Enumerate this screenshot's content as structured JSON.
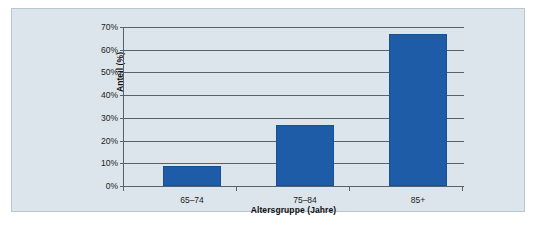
{
  "chart_data": {
    "type": "bar",
    "title": "",
    "subtitle": "",
    "categories": [
      "65–74",
      "75–84",
      "85+"
    ],
    "values": [
      9,
      27,
      67
    ],
    "series": [
      {
        "name": "Anteil",
        "values": [
          9,
          27,
          67
        ]
      }
    ],
    "xlabel": "Altersgruppe (Jahre)",
    "ylabel": "Anteil (%)",
    "ylim": [
      0,
      70
    ],
    "ytick_values": [
      0,
      10,
      20,
      30,
      40,
      50,
      60,
      70
    ],
    "ytick_labels": [
      "0%",
      "10%",
      "20%",
      "30%",
      "40%",
      "50%",
      "60%",
      "70%"
    ],
    "grid": true,
    "legend": null,
    "legend_position": "none",
    "annotations": [],
    "colors": {
      "bar_fill": "#1F5CA8",
      "bar_edge": "#17518F",
      "panel_background": "#DDE5EC",
      "panel_border": "#B9C6D4",
      "axis_line": "#56636E",
      "gridline": "#56636E",
      "text": "#1B1B1B",
      "page_background": "#FFFFFF"
    }
  }
}
